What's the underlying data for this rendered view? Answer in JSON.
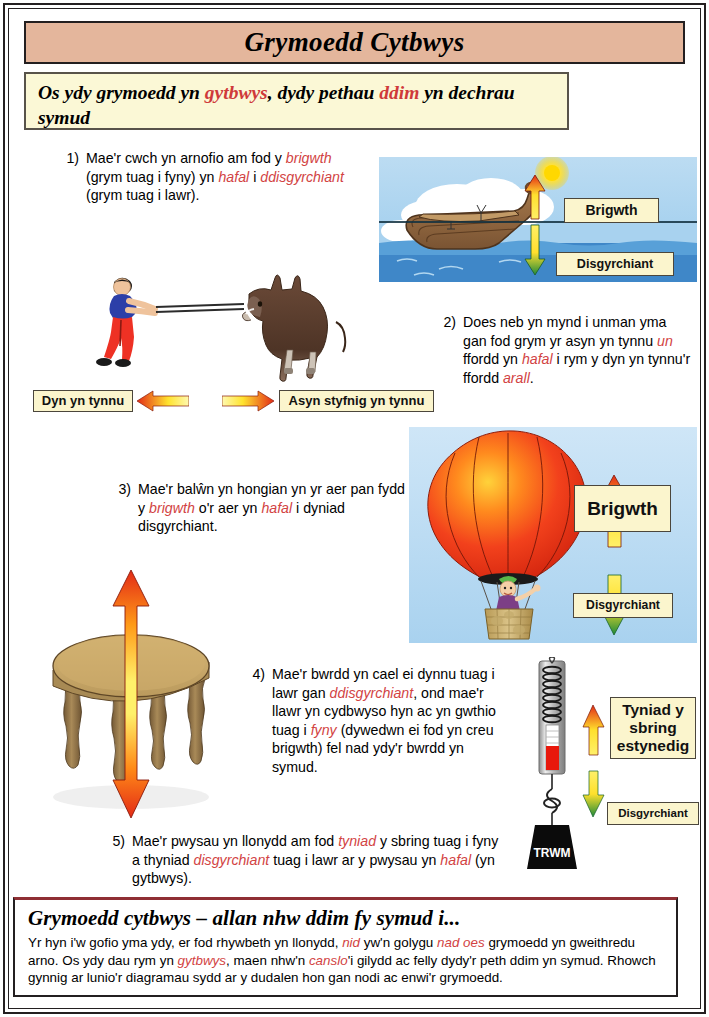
{
  "header": {
    "title": "Grymoedd Cytbwys"
  },
  "subtitle": {
    "part1": "Os ydy grymoedd yn ",
    "accent1": "gytbwys",
    "part2": ", dydy pethau ",
    "accent2": "ddim",
    "part3": " yn dechrau symud"
  },
  "items": [
    {
      "number": "1)",
      "segments": [
        {
          "t": "Mae'r cwch yn arnofio am fod y ",
          "em": false
        },
        {
          "t": "brigwth",
          "em": true
        },
        {
          "t": " (grym tuag i fyny) yn ",
          "em": false
        },
        {
          "t": "hafal",
          "em": true
        },
        {
          "t": " i ",
          "em": false
        },
        {
          "t": "ddisgyrchiant",
          "em": true
        },
        {
          "t": " (grym tuag i lawr).",
          "em": false
        }
      ]
    },
    {
      "number": "2)",
      "segments": [
        {
          "t": "Does neb yn mynd i unman yma gan fod grym yr asyn yn tynnu ",
          "em": false
        },
        {
          "t": "un",
          "em": true
        },
        {
          "t": " ffordd yn ",
          "em": false
        },
        {
          "t": "hafal",
          "em": true
        },
        {
          "t": " i rym y dyn yn tynnu'r ffordd ",
          "em": false
        },
        {
          "t": "arall",
          "em": true
        },
        {
          "t": ".",
          "em": false
        }
      ]
    },
    {
      "number": "3)",
      "segments": [
        {
          "t": "Mae'r balŵn yn hongian yn yr aer pan fydd y ",
          "em": false
        },
        {
          "t": "brigwth",
          "em": true
        },
        {
          "t": " o'r aer yn ",
          "em": false
        },
        {
          "t": "hafal",
          "em": true
        },
        {
          "t": " i dyniad disgyrchiant.",
          "em": false
        }
      ]
    },
    {
      "number": "4)",
      "segments": [
        {
          "t": "Mae'r bwrdd yn cael ei dynnu tuag i lawr gan ",
          "em": false
        },
        {
          "t": "ddisgyrchiant",
          "em": true
        },
        {
          "t": ", ond mae'r llawr yn cydbwyso hyn ac yn gwthio tuag i ",
          "em": false
        },
        {
          "t": "fyny",
          "em": true
        },
        {
          "t": " (dywedwn ei fod yn creu brigwth) fel nad ydy'r bwrdd yn symud.",
          "em": false
        }
      ]
    },
    {
      "number": "5)",
      "segments": [
        {
          "t": "Mae'r pwysau yn llonydd am fod ",
          "em": false
        },
        {
          "t": "tyniad",
          "em": true
        },
        {
          "t": " y sbring tuag i fyny a thyniad ",
          "em": false
        },
        {
          "t": "disgyrchiant",
          "em": true
        },
        {
          "t": " tuag i lawr ar y pwysau yn ",
          "em": false
        },
        {
          "t": "hafal",
          "em": true
        },
        {
          "t": " (yn gytbwys).",
          "em": false
        }
      ]
    }
  ],
  "labels": {
    "boat_up": "Brigwth",
    "boat_down": "Disgyrchiant",
    "man_pull": "Dyn yn tynnu",
    "donkey_pull": "Asyn styfnig yn tynnu",
    "balloon_up": "Brigwth",
    "balloon_down": "Disgyrchiant",
    "spring_up": "Tyniad y sbring estynedig",
    "spring_down": "Disgyrchiant",
    "weight": "TRWM"
  },
  "summary": {
    "heading": "Grymoedd cytbwys – allan nhw ddim fy symud i...",
    "segments": [
      {
        "t": "Yr hyn i'w gofio yma ydy, er fod rhywbeth yn llonydd, ",
        "em": false
      },
      {
        "t": "nid",
        "em": true
      },
      {
        "t": " yw'n golygu ",
        "em": false
      },
      {
        "t": "nad oes",
        "em": true
      },
      {
        "t": " grymoedd yn gweithredu arno. Os ydy dau rym yn ",
        "em": false
      },
      {
        "t": "gytbwys",
        "em": true
      },
      {
        "t": ", maen nhw'n ",
        "em": false
      },
      {
        "t": "canslo",
        "em": true
      },
      {
        "t": "'i gilydd ac felly dydy'r peth ddim yn symud. Rhowch gynnig ar lunio'r diagramau sydd ar y dudalen hon gan nodi ac enwi'r grymoedd.",
        "em": false
      }
    ]
  },
  "colors": {
    "header_bg": "#e4b69c",
    "cream": "#fbf8d6",
    "accent_red": "#cf3a3a",
    "frame": "#231f20",
    "sky": "#a8d2ef",
    "arrow_red": "#e02b18",
    "arrow_yellow": "#ffee4f",
    "arrow_green": "#1f8a3a",
    "summary_rule": "#8f2f34"
  }
}
